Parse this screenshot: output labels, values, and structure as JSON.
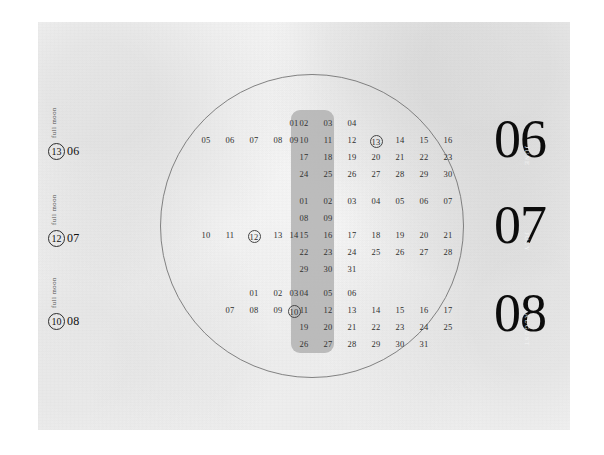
{
  "poster": {
    "title": "Summer calendar poster",
    "background_color": "#f8f8f8",
    "band_color": "#b0b0b0",
    "ink_color": "#2e2e2e"
  },
  "moons": [
    {
      "label": "full moon",
      "day": "13",
      "month": "06"
    },
    {
      "label": "full moon",
      "day": "12",
      "month": "07"
    },
    {
      "label": "full moon",
      "day": "10",
      "month": "08"
    }
  ],
  "months": [
    {
      "number": "06",
      "name": "JUNE"
    },
    {
      "number": "07",
      "name": "JULY"
    },
    {
      "number": "08",
      "name": "AUGUST"
    }
  ],
  "calendars": [
    {
      "month": "06",
      "name": "JUNE",
      "highlight_day": "13",
      "weeks": [
        [
          "",
          "",
          "",
          "",
          "01",
          "02",
          "03",
          "04"
        ],
        [
          "05",
          "06",
          "07",
          "08",
          "09",
          "10",
          "11",
          "12",
          "13",
          "14",
          "15",
          "16"
        ],
        [
          "17",
          "18",
          "19",
          "20",
          "21",
          "22",
          "23"
        ],
        [
          "24",
          "25",
          "26",
          "27",
          "28",
          "29",
          "30"
        ]
      ],
      "rows": [
        {
          "start": 4,
          "days": [
            "01",
            "02",
            "03",
            "04"
          ]
        },
        {
          "start": 0,
          "days": [
            "05",
            "06",
            "07",
            "08",
            "09",
            "10",
            "11",
            "12",
            "13",
            "14",
            "15",
            "16"
          ]
        },
        {
          "start": 5,
          "days": [
            "17",
            "18",
            "19",
            "20",
            "21",
            "22",
            "23"
          ]
        },
        {
          "start": 5,
          "days": [
            "24",
            "25",
            "26",
            "27",
            "28",
            "29",
            "30"
          ]
        }
      ]
    },
    {
      "month": "07",
      "name": "JULY",
      "highlight_day": "12",
      "rows": [
        {
          "start": 5,
          "days": [
            "01",
            "02",
            "03",
            "04",
            "05",
            "06",
            "07"
          ]
        },
        {
          "start": 5,
          "days": [
            "08",
            "09"
          ]
        },
        {
          "start": 0,
          "days": [
            "10",
            "11",
            "12",
            "13",
            "14",
            "15",
            "16",
            "17",
            "18",
            "19",
            "20",
            "21"
          ]
        },
        {
          "start": 5,
          "days": [
            "22",
            "23",
            "24",
            "25",
            "26",
            "27",
            "28"
          ]
        },
        {
          "start": 5,
          "days": [
            "29",
            "30",
            "31"
          ]
        }
      ]
    },
    {
      "month": "08",
      "name": "AUGUST",
      "highlight_day": "10",
      "rows": [
        {
          "start": 2,
          "days": [
            "01",
            "02",
            "03",
            "04",
            "05",
            "06"
          ]
        },
        {
          "start": 1,
          "days": [
            "07",
            "08",
            "09",
            "10",
            "11",
            "12",
            "13",
            "14",
            "15",
            "16",
            "17",
            "18"
          ]
        },
        {
          "start": 5,
          "days": [
            "19",
            "20",
            "21",
            "22",
            "23",
            "24",
            "25"
          ]
        },
        {
          "start": 5,
          "days": [
            "26",
            "27",
            "28",
            "29",
            "30",
            "31"
          ]
        }
      ]
    }
  ]
}
